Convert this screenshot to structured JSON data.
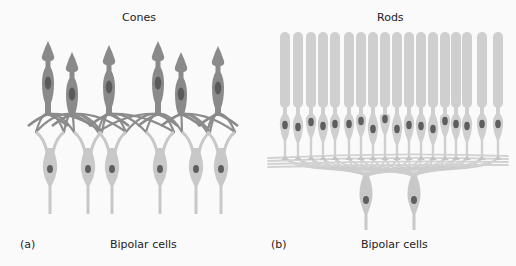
{
  "panel_a": {
    "letter": "(a)",
    "title": "Cones",
    "bottom_label": "Bipolar cells",
    "cone_count": 6,
    "bipolar_count": 6
  },
  "panel_b": {
    "letter": "(b)",
    "title": "Rods",
    "bottom_label": "Bipolar cells",
    "rod_count": 18,
    "bipolar_count": 2
  },
  "colors": {
    "cone_fill": "#8a8a8a",
    "cone_nucleus": "#5a5a5a",
    "rod_fill": "#cfcfcf",
    "bipolar_fill": "#c8c8c8",
    "nucleus": "#5e5e5e",
    "background": "#fafafa"
  }
}
